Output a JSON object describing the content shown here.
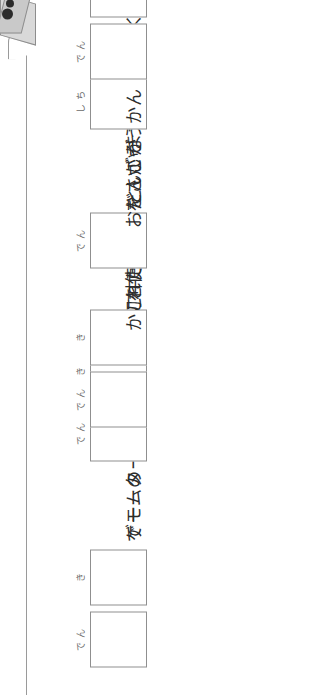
{
  "sheet": {
    "kind": "kanji-fill-in-worksheet",
    "orientation_note": "vertical Japanese text, page shown rotated",
    "banner": {
      "cursor_icon": "pointer-tab-icon"
    },
    "rows": [
      {
        "id": "row-1",
        "lead_text": "",
        "boxes": [
          {
            "hint": "でん"
          },
          {
            "hint": "き"
          }
        ],
        "trail_text": "でモーターが動く。",
        "trail_ruby": [
          {
            "base": "動",
            "reading": "うご"
          }
        ],
        "answer": "電気"
      },
      {
        "id": "row-2",
        "lead_text": "ゲームの",
        "boxes": [
          {
            "hint": "でん"
          },
          {
            "hint": "き"
          }
        ],
        "trail_text": "が切れた。",
        "trail_ruby": [
          {
            "base": "切",
            "reading": "き"
          }
        ],
        "answer": "電気"
      },
      {
        "id": "row-3",
        "lead_text": "",
        "boxes": [
          {
            "hint": "でん"
          },
          {
            "hint": "き"
          }
        ],
        "trail_text": "を使った物をさがそう。",
        "trail_ruby": [
          {
            "base": "使",
            "reading": "つか"
          },
          {
            "base": "物",
            "reading": "もの"
          }
        ],
        "answer": "電気"
      },
      {
        "id": "row-4",
        "lead_text": "かこ中",
        "lead_ruby": [
          {
            "base": "中",
            "reading": "ちゅう"
          }
        ],
        "boxes": [
          {
            "hint": "でん"
          }
        ],
        "trail_text": "といいます。",
        "trail_ruby": [],
        "answer": "電"
      },
      {
        "id": "row-5",
        "lead_text": "おだんごが",
        "lead_ruby": [],
        "boxes": [
          {
            "hint": "しち"
          }
        ],
        "trail_text": "に近くなる。",
        "trail_ruby": [
          {
            "base": "近",
            "reading": "ちか"
          }
        ],
        "answer": "七"
      },
      {
        "id": "row-6",
        "lead_text": "かん",
        "lead_ruby": [],
        "boxes": [
          {
            "hint": "でん"
          },
          {
            "hint": "き"
          }
        ],
        "trail_text": "を思い出す。",
        "trail_ruby": [
          {
            "base": "思",
            "reading": "おも"
          },
          {
            "base": "出",
            "reading": "だ"
          }
        ],
        "answer": "電気"
      }
    ]
  },
  "colors": {
    "ink": "#2d2d2d",
    "box_border": "#8f8f8f",
    "rule": "#9a9a9a",
    "tab_fill": "#d9d9d9",
    "paper": "#ffffff"
  }
}
